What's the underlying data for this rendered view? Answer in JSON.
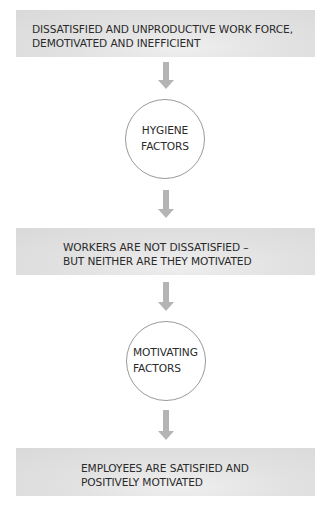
{
  "diagram": {
    "boxes": [
      {
        "id": "start-state",
        "lines": [
          "DISSATISFIED AND UNPRODUCTIVE WORK FORCE,",
          "DEMOTIVATED AND INEFFICIENT"
        ]
      },
      {
        "id": "intermediate-state",
        "lines": [
          "WORKERS ARE NOT DISSATISFIED –",
          "BUT NEITHER ARE THEY MOTIVATED"
        ]
      },
      {
        "id": "end-state",
        "lines": [
          "EMPLOYEES ARE SATISFIED AND",
          "POSITIVELY MOTIVATED"
        ]
      }
    ],
    "circles": [
      {
        "id": "hygiene-factors",
        "lines": [
          "HYGIENE",
          "FACTORS"
        ]
      },
      {
        "id": "motivating-factors",
        "lines": [
          "MOTIVATING",
          "FACTORS"
        ]
      }
    ],
    "arrows": [
      {
        "from": "start-state",
        "to": "hygiene-factors",
        "icon": "arrow-down-icon"
      },
      {
        "from": "hygiene-factors",
        "to": "intermediate-state",
        "icon": "arrow-down-icon"
      },
      {
        "from": "intermediate-state",
        "to": "motivating-factors",
        "icon": "arrow-down-icon"
      },
      {
        "from": "motivating-factors",
        "to": "end-state",
        "icon": "arrow-down-icon"
      }
    ],
    "colors": {
      "box_fill": "#dcdcdc",
      "arrow": "#b4b4b4",
      "circle_border": "#9a9a9a",
      "text": "#2a2a2a",
      "background": "#ffffff"
    }
  }
}
